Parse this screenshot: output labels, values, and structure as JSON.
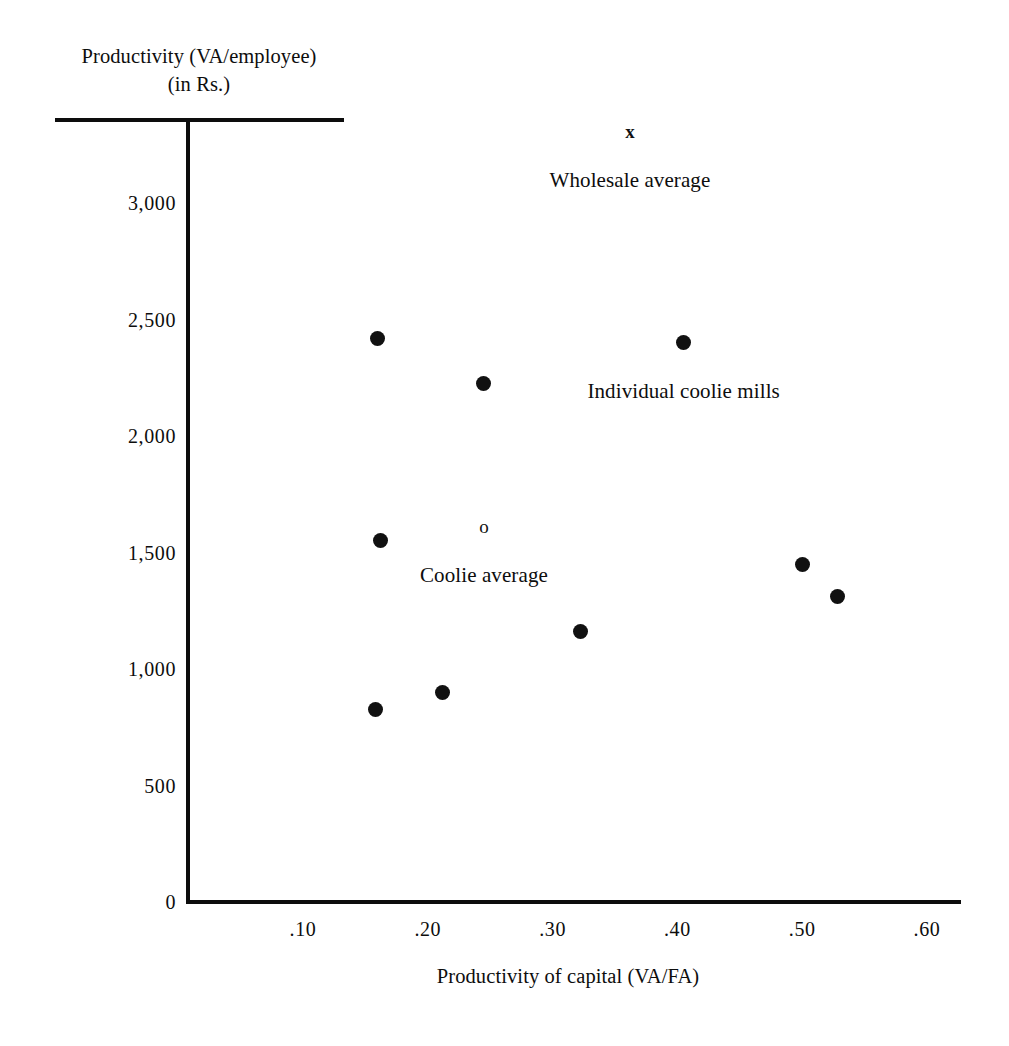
{
  "chart_data": {
    "type": "scatter",
    "title": "",
    "xlabel": "Productivity of capital (VA/FA)",
    "ylabel": "Productivity (VA/employee)",
    "ylabel_line2": "(in Rs.)",
    "xlim": [
      0.0,
      0.635
    ],
    "ylim": [
      0,
      3430
    ],
    "grid": false,
    "legend_position": "none",
    "xticks": [
      ".10",
      ".20",
      ".30",
      ".40",
      ".50",
      ".60"
    ],
    "xtick_values": [
      0.1,
      0.2,
      0.3,
      0.4,
      0.5,
      0.6
    ],
    "yticks": [
      "0",
      "500",
      "1,000",
      "1,500",
      "2,000",
      "2,500",
      "3,000"
    ],
    "ytick_values": [
      0,
      500,
      1000,
      1500,
      2000,
      2500,
      3000
    ],
    "series": [
      {
        "name": "Individual coolie mills",
        "marker": "filled-circle",
        "color": "#111111",
        "points": [
          {
            "x": 0.16,
            "y": 2420
          },
          {
            "x": 0.405,
            "y": 2400
          },
          {
            "x": 0.245,
            "y": 2225
          },
          {
            "x": 0.162,
            "y": 1550
          },
          {
            "x": 0.5,
            "y": 1450
          },
          {
            "x": 0.528,
            "y": 1310
          },
          {
            "x": 0.322,
            "y": 1160
          },
          {
            "x": 0.212,
            "y": 900
          },
          {
            "x": 0.158,
            "y": 825
          }
        ]
      },
      {
        "name": "Wholesale average",
        "marker": "x",
        "color": "#111111",
        "points": [
          {
            "x": 0.362,
            "y": 3310
          }
        ]
      },
      {
        "name": "Coolie average",
        "marker": "open-circle",
        "color": "#111111",
        "points": [
          {
            "x": 0.245,
            "y": 1615
          }
        ]
      }
    ],
    "annotations": [
      {
        "text": "Wholesale average",
        "x": 0.362,
        "y": 3150,
        "marker": "x"
      },
      {
        "text": "Individual coolie mills",
        "x": 0.405,
        "y": 2245,
        "marker": "filled-circle"
      },
      {
        "text": "Coolie average",
        "x": 0.245,
        "y": 1455,
        "marker": "open-circle"
      }
    ],
    "marker_glyphs": {
      "x": "x",
      "open_circle": "o"
    }
  }
}
